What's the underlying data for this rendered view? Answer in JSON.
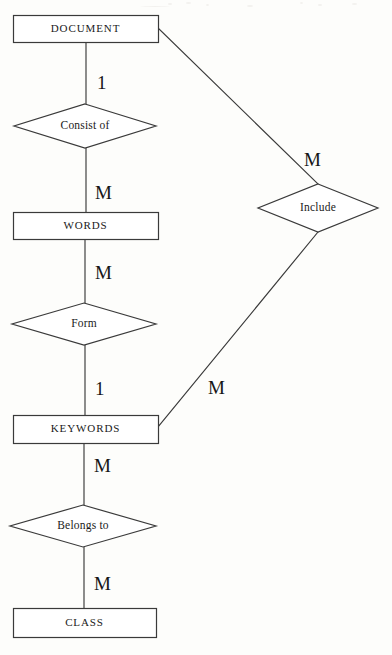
{
  "diagram": {
    "type": "er-diagram",
    "background_color": "#fdfdfb",
    "line_color": "#3a3a3a",
    "text_color": "#1a1a1a",
    "entities": [
      {
        "id": "document",
        "label": "DOCUMENT",
        "shape": "rectangle",
        "x": 13,
        "y": 15,
        "width": 145,
        "height": 27
      },
      {
        "id": "words",
        "label": "WORDS",
        "shape": "rectangle",
        "x": 13,
        "y": 212,
        "width": 145,
        "height": 27
      },
      {
        "id": "keywords",
        "label": "KEYWORDS",
        "shape": "rectangle",
        "x": 13,
        "y": 415,
        "width": 145,
        "height": 28
      },
      {
        "id": "class",
        "label": "CLASS",
        "shape": "rectangle",
        "x": 13,
        "y": 608,
        "width": 143,
        "height": 29
      }
    ],
    "relationships": [
      {
        "id": "consist-of",
        "label": "Consist of",
        "shape": "diamond",
        "cx": 85,
        "cy": 126,
        "rx": 71,
        "ry": 22
      },
      {
        "id": "form",
        "label": "Form",
        "shape": "diamond",
        "cx": 84,
        "cy": 324,
        "rx": 72,
        "ry": 21
      },
      {
        "id": "belongs-to",
        "label": "Belongs to",
        "shape": "diamond",
        "cx": 83,
        "cy": 526,
        "rx": 73,
        "ry": 21
      },
      {
        "id": "include",
        "label": "Include",
        "shape": "diamond",
        "cx": 318,
        "cy": 208,
        "rx": 60,
        "ry": 24
      }
    ],
    "connectors": [
      {
        "id": "document-consist",
        "from": "document",
        "to": "consist-of",
        "x1": 86,
        "y1": 42,
        "x2": 86,
        "y2": 104
      },
      {
        "id": "consist-words",
        "from": "consist-of",
        "to": "words",
        "x1": 86,
        "y1": 148,
        "x2": 86,
        "y2": 212
      },
      {
        "id": "words-form",
        "from": "words",
        "to": "form",
        "x1": 85,
        "y1": 239,
        "x2": 85,
        "y2": 303
      },
      {
        "id": "form-keywords",
        "from": "form",
        "to": "keywords",
        "x1": 85,
        "y1": 345,
        "x2": 85,
        "y2": 415
      },
      {
        "id": "keywords-belongs",
        "from": "keywords",
        "to": "belongs-to",
        "x1": 84,
        "y1": 443,
        "x2": 84,
        "y2": 505
      },
      {
        "id": "belongs-class",
        "from": "belongs-to",
        "to": "class",
        "x1": 84,
        "y1": 547,
        "x2": 84,
        "y2": 608
      },
      {
        "id": "document-include",
        "from": "document",
        "to": "include",
        "x1": 158,
        "y1": 28,
        "x2": 318,
        "y2": 184
      },
      {
        "id": "include-keywords",
        "from": "include",
        "to": "keywords",
        "x1": 318,
        "y1": 232,
        "x2": 158,
        "y2": 427
      }
    ],
    "cardinalities": [
      {
        "id": "card-document-consist",
        "value": "1",
        "connector": "document-consist",
        "x": 97,
        "y": 72
      },
      {
        "id": "card-consist-words",
        "value": "M",
        "connector": "consist-words",
        "x": 95,
        "y": 182
      },
      {
        "id": "card-words-form",
        "value": "M",
        "connector": "words-form",
        "x": 95,
        "y": 262
      },
      {
        "id": "card-form-keywords",
        "value": "1",
        "connector": "form-keywords",
        "x": 95,
        "y": 378
      },
      {
        "id": "card-keywords-belongs",
        "value": "M",
        "connector": "keywords-belongs",
        "x": 94,
        "y": 455
      },
      {
        "id": "card-belongs-class",
        "value": "M",
        "connector": "belongs-class",
        "x": 94,
        "y": 573
      },
      {
        "id": "card-include-top",
        "value": "M",
        "connector": "document-include",
        "x": 304,
        "y": 149
      },
      {
        "id": "card-include-bottom",
        "value": "M",
        "connector": "include-keywords",
        "x": 208,
        "y": 377
      }
    ]
  }
}
